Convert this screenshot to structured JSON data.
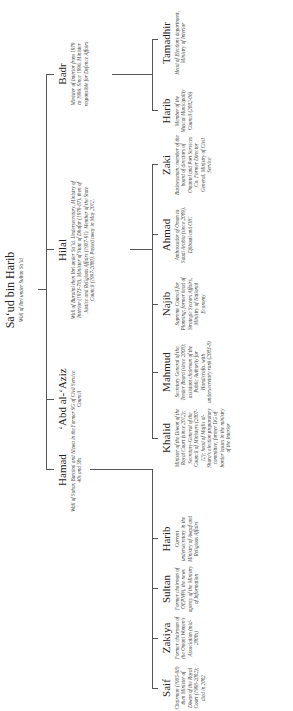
{
  "root": {
    "name": "Sa‘ud bin Harib",
    "desc": "Wali of Ibri under Sultan Sa‘id"
  },
  "children": [
    {
      "name": "Hamad",
      "desc": "Wali of Sohar, Buraimi and Nizwa in the 40s and 50s"
    },
    {
      "name": "‘Abd al-‘Aziz",
      "desc": "Former SG of Civil Service Council"
    },
    {
      "name": "Hilal",
      "desc": "Wali of Buraimi then Ibri under Sa‘id. Undersecretary, Ministry of Interior (1973-78), Minister of State of Dhofar (1979-87), then of Justice and Religious Affairs (1987-91). Member of the State Council (1997-2000). Passed away in May 2012."
    },
    {
      "name": "Badr",
      "desc": "Minister of Interior from 1979 to 1996. Since 1996, Minister responsible for Defence Affairs"
    }
  ],
  "grandchildren": {
    "hamad": [
      {
        "name": "Saif",
        "desc": "Chairman (1985-98) then Minister of Diwan of the Royal Court (1998-2002); died in 2002"
      },
      {
        "name": "Zakiya",
        "desc": "Former chairman of the Omani Women's Association (mid-2000s)"
      },
      {
        "name": "Sultan",
        "desc": "Former chairman of OEPNPA, the news agency of the Ministry of Information"
      },
      {
        "name": "Harib",
        "desc": "Current undersecretary in the Ministry of Awqaf and Religious Affairs"
      }
    ],
    "hilal": [
      {
        "name": "Khalid",
        "desc": "Minister of the Diwan of the Royal Court (since 2012); Secretary-General of the Council of Ministers (2007-12); head of Majlis al-Shura's election preparatory committee; former DG of border issues in the ministry of the Interior"
      },
      {
        "name": "Mahmud",
        "desc": "Secretary General of the Tender Board (since 2008); assistant chairman of the Public Authority for Handicrafts, with undersecretary rank (2003-8)"
      },
      {
        "name": "Najib",
        "desc": "Supreme Council for Planning; former head of Strategic Sectors Affairs, Ministry of National Economy"
      },
      {
        "name": "Ahmad",
        "desc": "Ambassador of Oman to Saudi Arabia (since 2009), Djibouti and OIC"
      },
      {
        "name": "Zaki",
        "desc": "Businessman; member of the board of directors of Omantel and Port Services Co. Former Director General, Ministry of Civil Service"
      }
    ],
    "badr": [
      {
        "name": "Harib",
        "desc": "Member of the Muscat Municipality Council (2002-06)"
      },
      {
        "name": "Tamadhir",
        "desc": "Head of Elections department, Ministry of Interior"
      }
    ]
  }
}
